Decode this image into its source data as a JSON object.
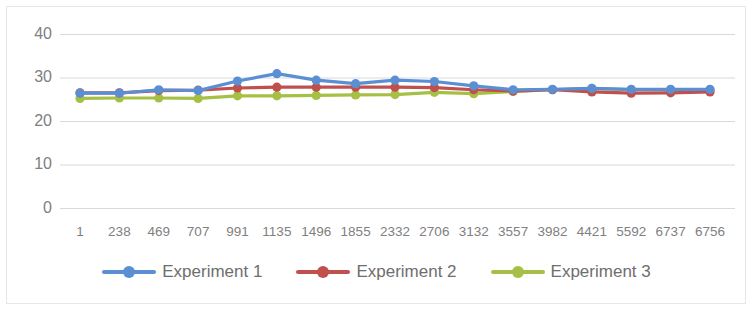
{
  "chart_data": {
    "type": "line",
    "title": "",
    "subtitle": "",
    "xlabel": "",
    "ylabel": "",
    "ylim": [
      0,
      40
    ],
    "yticks": [
      0,
      10,
      20,
      30,
      40
    ],
    "grid": true,
    "legend_position": "bottom",
    "categories": [
      "1",
      "238",
      "469",
      "707",
      "991",
      "1135",
      "1496",
      "1855",
      "2332",
      "2706",
      "3132",
      "3557",
      "3982",
      "4421",
      "5592",
      "6737",
      "6756"
    ],
    "series": [
      {
        "name": "Experiment 1",
        "color": "#5B8FD4",
        "values": [
          26.5,
          26.5,
          27.3,
          27.1,
          29.3,
          31.0,
          29.5,
          28.7,
          29.5,
          29.2,
          28.2,
          27.3,
          27.4,
          27.6,
          27.4,
          27.4,
          27.4
        ]
      },
      {
        "name": "Experiment 2",
        "color": "#C0504D",
        "values": [
          26.6,
          26.6,
          27.1,
          27.2,
          27.7,
          27.9,
          27.9,
          27.9,
          27.9,
          27.8,
          27.3,
          27.0,
          27.3,
          26.8,
          26.5,
          26.6,
          26.8
        ]
      },
      {
        "name": "Experiment 3",
        "color": "#A5C044",
        "values": [
          25.3,
          25.4,
          25.4,
          25.3,
          25.9,
          25.9,
          26.0,
          26.1,
          26.2,
          26.7,
          26.4,
          26.9,
          27.3,
          27.6,
          27.3,
          27.3,
          27.2
        ]
      }
    ]
  },
  "legend": {
    "items": [
      {
        "label": "Experiment 1",
        "color": "#5B8FD4"
      },
      {
        "label": "Experiment 2",
        "color": "#C0504D"
      },
      {
        "label": "Experiment 3",
        "color": "#A5C044"
      }
    ]
  },
  "axis": {
    "y_tick_labels": [
      "40",
      "30",
      "20",
      "10",
      "0"
    ],
    "gridline_color": "#d9d9d9",
    "tick_text_color": "#808080"
  }
}
